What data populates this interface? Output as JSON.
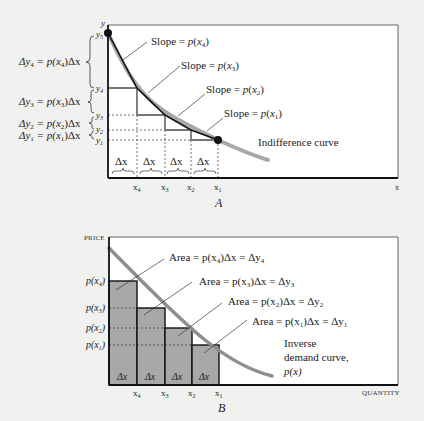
{
  "panel_a": {
    "caption": "A",
    "y_axis_label": "y",
    "x_axis_label": "x",
    "curve_label": "Indifference curve",
    "y_ticks": [
      "y5",
      "y4",
      "y3",
      "y2",
      "y1"
    ],
    "y_ticks_display": {
      "y5": "y",
      "y4": "y",
      "y3": "y",
      "y2": "y",
      "y1": "y"
    },
    "y_sub": {
      "y5": "5",
      "y4": "4",
      "y3": "3",
      "y2": "2",
      "y1": "1"
    },
    "x_ticks_display": {
      "x4": "x",
      "x3": "x",
      "x2": "x",
      "x1": "x"
    },
    "x_sub": {
      "x4": "4",
      "x3": "3",
      "x2": "2",
      "x1": "1"
    },
    "delta_x_label": "Δx",
    "slope_labels": [
      {
        "prefix": "Slope = ",
        "fn": "p",
        "arg": "x",
        "sub": "4"
      },
      {
        "prefix": "Slope = ",
        "fn": "p",
        "arg": "x",
        "sub": "3"
      },
      {
        "prefix": "Slope = ",
        "fn": "p",
        "arg": "x",
        "sub": "2"
      },
      {
        "prefix": "Slope = ",
        "fn": "p",
        "arg": "x",
        "sub": "1"
      }
    ],
    "delta_y_labels": [
      {
        "lhs": "Δy",
        "sub": "4",
        "rhs": " = p(x",
        "rsub": "4",
        "tail": ")Δx"
      },
      {
        "lhs": "Δy",
        "sub": "3",
        "rhs": " = p(x",
        "rsub": "3",
        "tail": ")Δx"
      },
      {
        "lhs": "Δy",
        "sub": "2",
        "rhs": " = p(x",
        "rsub": "2",
        "tail": ")Δx"
      },
      {
        "lhs": "Δy",
        "sub": "1",
        "rhs": " = p(x",
        "rsub": "1",
        "tail": ")Δx"
      }
    ]
  },
  "panel_b": {
    "caption": "B",
    "y_axis_label": "PRICE",
    "x_axis_label": "QUANTITY",
    "curve_label_lines": [
      "Inverse",
      "demand curve,",
      "p(x)"
    ],
    "price_ticks": [
      {
        "fn": "p(x",
        "sub": "4",
        "tail": ")"
      },
      {
        "fn": "p(x",
        "sub": "3",
        "tail": ")"
      },
      {
        "fn": "p(x",
        "sub": "2",
        "tail": ")"
      },
      {
        "fn": "p(x",
        "sub": "1",
        "tail": ")"
      }
    ],
    "x_ticks_display": {
      "x4": "x",
      "x3": "x",
      "x2": "x",
      "x1": "x"
    },
    "x_sub": {
      "x4": "4",
      "x3": "3",
      "x2": "2",
      "x1": "1"
    },
    "delta_x_label": "Δx",
    "area_labels": [
      {
        "prefix": "Area = p(x",
        "sub": "4",
        "mid": ")Δx = Δy",
        "sub2": "4"
      },
      {
        "prefix": "Area = p(x",
        "sub": "3",
        "mid": ")Δx = Δy",
        "sub2": "3"
      },
      {
        "prefix": "Area = p(x",
        "sub": "2",
        "mid": ")Δx = Δy",
        "sub2": "2"
      },
      {
        "prefix": "Area = p(x",
        "sub": "1",
        "mid": ")Δx = Δy",
        "sub2": "1"
      }
    ]
  },
  "colors": {
    "background": "#f1f1ef",
    "frame": "#1a1a1a",
    "curve_gray": "#9a9a9a",
    "step_gray": "#777777",
    "bar_fill": "#a8a8a8",
    "plot_bg": "#ffffff"
  }
}
